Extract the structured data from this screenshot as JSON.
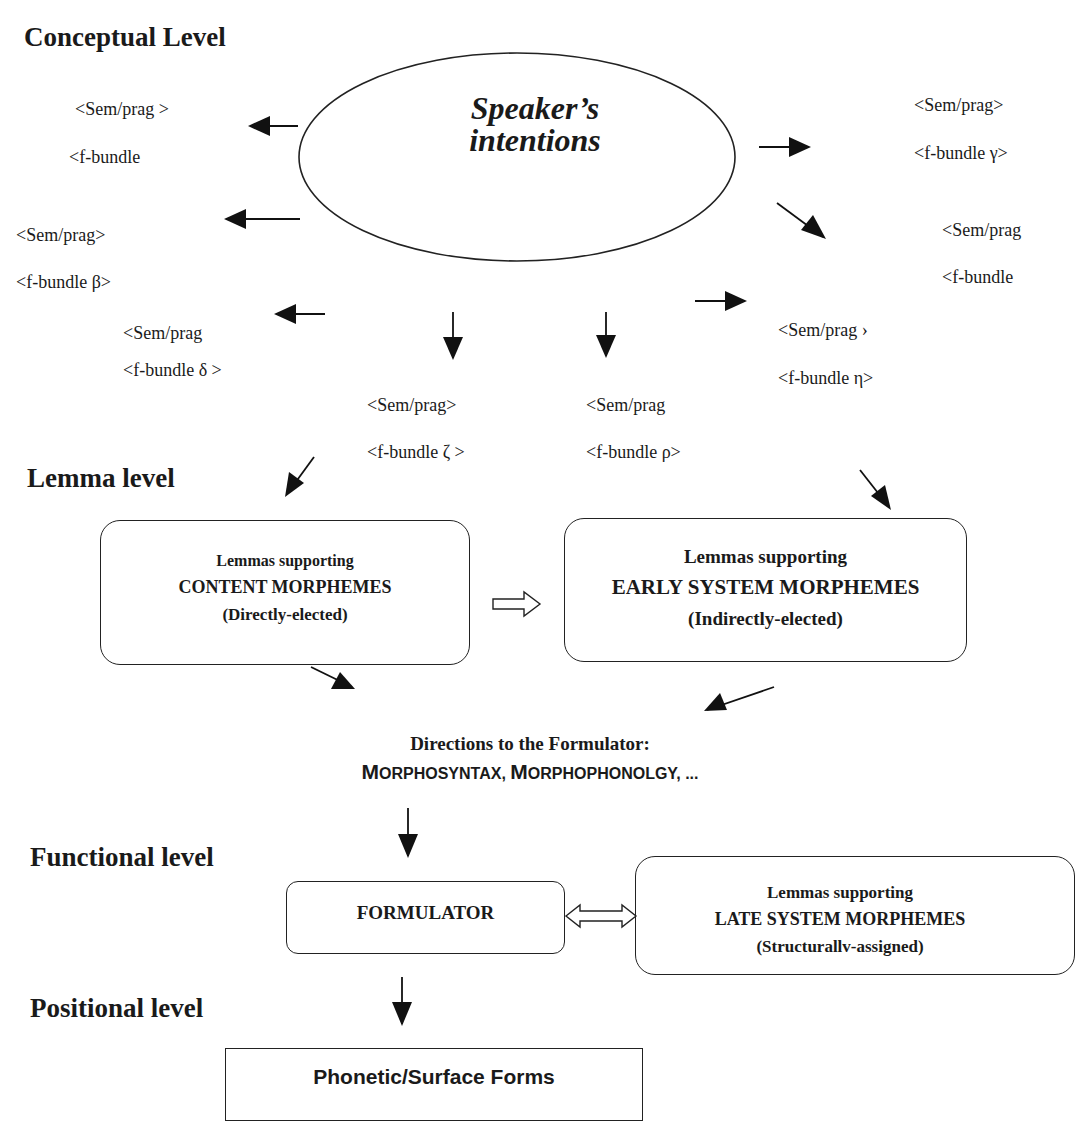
{
  "levels": {
    "conceptual": "Conceptual Level",
    "lemma": "Lemma level",
    "functional": "Functional level",
    "positional": "Positional level"
  },
  "ellipse": {
    "line1": "Speaker’s",
    "line2": "intentions"
  },
  "bundles": [
    {
      "id": "top-left",
      "sem": "<Sem/prag >",
      "f": "<f-bundle"
    },
    {
      "id": "beta",
      "sem": "<Sem/prag>",
      "f": "<f-bundle β>"
    },
    {
      "id": "delta",
      "sem": "<Sem/prag",
      "f": "<f-bundle  δ >"
    },
    {
      "id": "zeta",
      "sem": "<Sem/prag>",
      "f": "<f-bundle ζ >"
    },
    {
      "id": "rho",
      "sem": "<Sem/prag",
      "f": "<f-bundle ρ>"
    },
    {
      "id": "eta",
      "sem": "<Sem/prag ›",
      "f": "<f-bundle η>"
    },
    {
      "id": "gamma",
      "sem": "<Sem/prag>",
      "f": "<f-bundle γ>"
    },
    {
      "id": "right-partial",
      "sem": "<Sem/prag",
      "f": "<f-bundle"
    }
  ],
  "content_box": {
    "line1": "Lemmas supporting",
    "line2": "CONTENT MORPHEMES",
    "line3": "(Directly-elected)"
  },
  "early_box": {
    "line1": "Lemmas supporting",
    "line2": "EARLY SYSTEM MORPHEMES",
    "line3": "(Indirectly-elected)"
  },
  "directions": {
    "line1": "Directions to the Formulator:",
    "line2_parts": [
      {
        "big": "M",
        "small": "ORPHOSYNTAX, "
      },
      {
        "big": "M",
        "small": "ORPHOPHONOLGY, ..."
      }
    ]
  },
  "formulator_box": {
    "label": "FORMULATOR"
  },
  "late_box": {
    "line1": "Lemmas supporting",
    "line2": "LATE SYSTEM MORPHEMES",
    "line3": "(Structurallv-assigned)"
  },
  "surface_box": {
    "label": "Phonetic/Surface Forms"
  },
  "colors": {
    "ink": "#1a1a1a",
    "background": "#ffffff"
  }
}
